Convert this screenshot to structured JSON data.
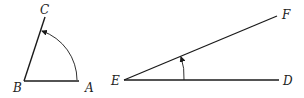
{
  "figure": {
    "left_angle": {
      "vertex_label": "B",
      "ray1_label": "A",
      "ray2_label": "C",
      "arc_direction": "counterclockwise from BA to BC"
    },
    "right_angle": {
      "vertex_label": "E",
      "ray1_label": "D",
      "ray2_label": "F",
      "arc_direction": "counterclockwise from ED to EF"
    },
    "colors": {
      "line": "#1a1a1a",
      "background": "#ffffff"
    }
  }
}
